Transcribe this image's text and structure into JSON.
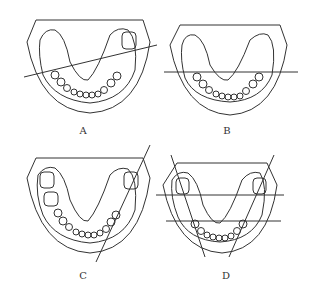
{
  "figure": {
    "panels": [
      {
        "id": "A",
        "label": "A",
        "description": "Lower dental arch with oblique line across from left premolars to right molar"
      },
      {
        "id": "B",
        "label": "B",
        "description": "Lower dental arch with horizontal line across premolar region"
      },
      {
        "id": "C",
        "label": "C",
        "description": "Lower dental arch with line along the right tooth row"
      },
      {
        "id": "D",
        "label": "D",
        "description": "Lower dental arch with two horizontal lines and two oblique lines along both tooth rows"
      }
    ],
    "colors": {
      "stroke": "#333333",
      "background": "#ffffff"
    }
  }
}
